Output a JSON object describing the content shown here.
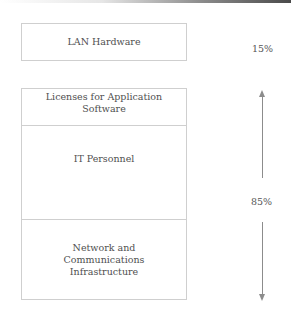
{
  "diagram": {
    "boxes": {
      "lan_hardware": "LAN Hardware",
      "licenses": "Licenses for Application Software",
      "it_personnel": "IT Personnel",
      "network_line1": "Network and",
      "network_line2": "Communications",
      "network_line3": "Infrastructure"
    },
    "percentages": {
      "lan_hardware": "15%",
      "remaining": "85%"
    },
    "arrows": {
      "up": "arrow-up",
      "down": "arrow-down"
    },
    "colors": {
      "border": "#cfcfcf",
      "text": "#505050",
      "arrow": "#8c8c8c"
    }
  }
}
